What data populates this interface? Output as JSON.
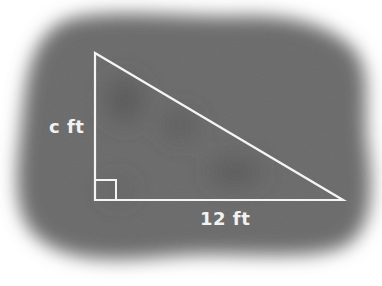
{
  "diagram": {
    "type": "right-triangle",
    "background_color": "#6a6a6a",
    "line_color": "#f4f4f4",
    "labels": {
      "vertical_leg": "c ft",
      "horizontal_leg": "12 ft"
    },
    "vertices": {
      "top": [
        95,
        53
      ],
      "right_angle": [
        95,
        200
      ],
      "right": [
        343,
        200
      ]
    },
    "right_angle_marker": true
  }
}
